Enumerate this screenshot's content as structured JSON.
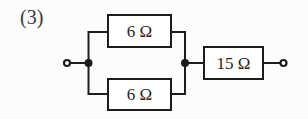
{
  "figure": {
    "label": "(3)",
    "type": "circuit-diagram",
    "resistors": {
      "parallel_top": "6 Ω",
      "parallel_bottom": "6 Ω",
      "series": "15 Ω"
    },
    "colors": {
      "line": "#1c1c1c",
      "text": "#262626",
      "background": "#fcfcfc"
    }
  }
}
